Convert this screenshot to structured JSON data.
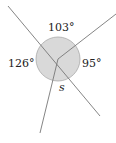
{
  "diagram": {
    "type": "angles-around-point",
    "circle": {
      "cx": 58,
      "cy": 59,
      "r": 22,
      "fill": "#d9d9d9",
      "stroke": "#aaaaaa"
    },
    "lines": [
      {
        "id": "line-upper-left-to-lower-right",
        "x1": 8,
        "y1": 6,
        "x2": 100,
        "y2": 116
      },
      {
        "id": "ray-upper-right",
        "x1": 58,
        "y1": 59,
        "x2": 116,
        "y2": 14
      },
      {
        "id": "ray-down",
        "x1": 58,
        "y1": 59,
        "x2": 40,
        "y2": 133
      }
    ],
    "line_color": "#777777",
    "labels": {
      "top": "103°",
      "left": "126°",
      "right": "95°",
      "bottom": "s"
    }
  }
}
